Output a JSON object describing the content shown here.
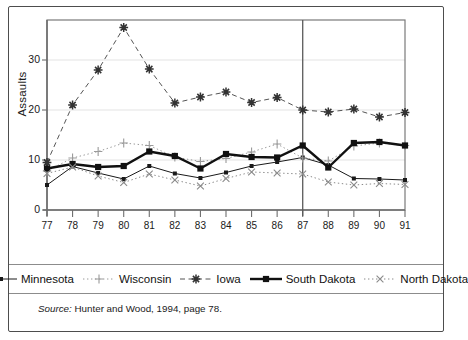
{
  "figure": {
    "source_prefix": "Source:",
    "source_text": " Hunter and Wood, 1994, page 78."
  },
  "chart_data": {
    "type": "line",
    "title": "",
    "xlabel": "",
    "ylabel": "Assaults",
    "x": [
      "77",
      "78",
      "79",
      "80",
      "81",
      "82",
      "83",
      "84",
      "85",
      "86",
      "87",
      "88",
      "89",
      "90",
      "91"
    ],
    "xlim": [
      77,
      91
    ],
    "ylim": [
      0,
      38
    ],
    "yticks": [
      0,
      10,
      20,
      30
    ],
    "ytick_labels": [
      "0",
      "10",
      "20",
      "30"
    ],
    "grid": "horizontal-light",
    "legend_position": "below-plot",
    "annotations": [
      {
        "type": "vertical-line",
        "x": "87",
        "label": ""
      }
    ],
    "series": [
      {
        "name": "Minnesota",
        "color": "#1a1a1a",
        "marker": "small-square",
        "line_style": "solid",
        "line_width": 1,
        "values": [
          5.0,
          8.7,
          7.4,
          6.2,
          8.8,
          7.3,
          6.4,
          7.5,
          8.8,
          9.6,
          10.5,
          9.0,
          6.3,
          6.2,
          6.0
        ]
      },
      {
        "name": "Wisconsin",
        "color": "#9a9a9a",
        "marker": "plus",
        "line_style": "dotted",
        "line_width": 1,
        "values": [
          7.8,
          10.4,
          11.7,
          13.4,
          12.9,
          10.6,
          9.7,
          10.3,
          11.6,
          13.2,
          10.4,
          9.8,
          12.8,
          13.4,
          12.9
        ]
      },
      {
        "name": "Iowa",
        "color": "#555555",
        "marker": "asterisk",
        "line_style": "dashed",
        "line_width": 1,
        "values": [
          9.5,
          21.0,
          28.0,
          36.5,
          28.2,
          21.4,
          22.6,
          23.6,
          21.5,
          22.5,
          20.0,
          19.6,
          20.2,
          18.6,
          19.5
        ]
      },
      {
        "name": "South Dakota",
        "color": "#111111",
        "marker": "filled-square",
        "line_style": "solid",
        "line_width": 2.4,
        "values": [
          8.3,
          9.2,
          8.6,
          8.8,
          11.7,
          10.8,
          8.3,
          11.2,
          10.6,
          10.5,
          12.9,
          8.5,
          13.4,
          13.6,
          12.9
        ]
      },
      {
        "name": "North Dakota",
        "color": "#8a8a8a",
        "marker": "cross",
        "line_style": "dotted",
        "line_width": 1,
        "values": [
          7.3,
          8.6,
          6.8,
          5.5,
          7.2,
          6.0,
          4.8,
          6.3,
          7.6,
          7.4,
          7.2,
          5.6,
          5.0,
          5.3,
          5.1
        ]
      }
    ]
  }
}
